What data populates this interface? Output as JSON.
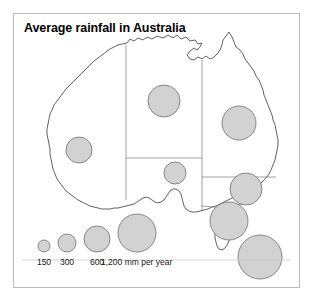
{
  "figure": {
    "title": "Average rainfall in Australia",
    "frame_color": "#b9b9b9",
    "background": "#ffffff"
  },
  "style": {
    "bubble_fill": "#d2d2d2",
    "bubble_stroke": "#6e6e6e",
    "map_stroke": "#3a3a3a",
    "border_stroke": "#7a7a7a"
  },
  "chart_data": {
    "type": "bubble-map",
    "title": "Average rainfall in Australia",
    "unit": "mm per year",
    "value_label": "1,200 mm per year",
    "legend_position": "bottom-left",
    "grid": false,
    "size_encoding": "area-proportional-to-rainfall",
    "legend": {
      "entries": [
        {
          "label": "150",
          "value": 150,
          "radius": 6
        },
        {
          "label": "300",
          "value": 300,
          "radius": 9
        },
        {
          "label": "600",
          "value": 600,
          "radius": 13
        },
        {
          "label": "1,200 mm per year",
          "value": 1200,
          "radius": 19
        }
      ]
    },
    "points": [
      {
        "name": "Western Australia",
        "value": 300,
        "radius": 13,
        "cx": 65,
        "cy": 136
      },
      {
        "name": "Northern Territory",
        "value": 600,
        "radius": 16,
        "cx": 150,
        "cy": 87
      },
      {
        "name": "Queensland",
        "value": 600,
        "radius": 17,
        "cx": 225,
        "cy": 109
      },
      {
        "name": "South Australia",
        "value": 300,
        "radius": 11,
        "cx": 161,
        "cy": 159
      },
      {
        "name": "New South Wales",
        "value": 600,
        "radius": 16,
        "cx": 232,
        "cy": 175
      },
      {
        "name": "Victoria",
        "value": 1200,
        "radius": 19,
        "cx": 215,
        "cy": 207
      },
      {
        "name": "Tasmania",
        "value": 1200,
        "radius": 22,
        "cx": 246,
        "cy": 243
      }
    ]
  }
}
